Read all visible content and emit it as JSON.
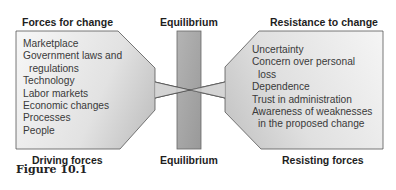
{
  "diagram": {
    "title_left": "Forces for change",
    "title_center_top": "Equilibrium",
    "title_right": "Resistance to change",
    "caption_left": "Driving forces",
    "caption_center_bottom": "Equilibrium",
    "caption_right": "Resisting forces",
    "driving_forces": [
      {
        "text": "Marketplace",
        "indent": false
      },
      {
        "text": "Government laws and",
        "indent": false
      },
      {
        "text": "regulations",
        "indent": true
      },
      {
        "text": "Technology",
        "indent": false
      },
      {
        "text": "Labor markets",
        "indent": false
      },
      {
        "text": "Economic changes",
        "indent": false
      },
      {
        "text": "Processes",
        "indent": false
      },
      {
        "text": "People",
        "indent": false
      }
    ],
    "resisting_forces": [
      {
        "text": "Uncertainty",
        "indent": false
      },
      {
        "text": "Concern over personal",
        "indent": false
      },
      {
        "text": "loss",
        "indent": true
      },
      {
        "text": "Dependence",
        "indent": false
      },
      {
        "text": "Trust in administration",
        "indent": false
      },
      {
        "text": "Awareness of weaknesses",
        "indent": false
      },
      {
        "text": "in the proposed change",
        "indent": true
      }
    ],
    "colors": {
      "shape_light": "#f4f4f4",
      "shape_dark": "#bdbdbd",
      "bar_fill": "#a9a9a9",
      "outline": "#555555"
    }
  },
  "figure_label": "Figure 10.1"
}
